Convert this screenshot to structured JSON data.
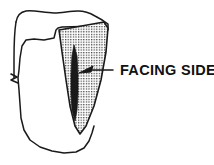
{
  "figure": {
    "background_color": "#ffffff",
    "ink_color": "#1a1a1a",
    "stipple_color": "#3a3a3a",
    "stipple_fill_color": "#e8e8e8",
    "blade_fill_color": "#1a1a1a"
  },
  "annotations": {
    "facing_side_label": "FACING SIDE"
  },
  "parts": {
    "stone_block_name": "stone-block",
    "facing_face_name": "facing-face",
    "break_mark_name": "break-mark",
    "blade_name": "blade-lens",
    "leader_name": "leader-line",
    "arrowhead_name": "arrowhead"
  },
  "geometry": {
    "width": 214,
    "height": 165,
    "stone_outline": "M 16,22 C 17,16 20,12 26,11 C 35,10 44,13 54,13 C 62,13 70,11 78,11 C 84,11 90,13 95,16 C 99,18 104,21 108,24 L 108,30 L 100,26 L 62,27 L 58,28 L 56,30 L 54,38 L 44,40 L 34,39 L 26,40 L 22,46 L 20,58 L 19,70 L 18,78 L 19,90 L 20,104 L 21,118 L 24,130 L 30,140 L 40,147 L 52,151 L 64,153 L 76,152 L 84,148 L 89,141 L 92,133 L 94,126",
    "stone_left_edge": "M 16,22 C 14,34 14,48 14,60 L 14,74 L 14,78",
    "facing_face": "M 59,30 L 104,22 L 108,28 L 106,52 L 101,80 L 94,106 L 86,126 L 80,134 L 75,126 L 70,106 L 66,80 L 62,52 Z",
    "blade_lens": "M 74,45 L 77,56 L 78,74 L 78,94 L 77,110 L 75,121 L 72,110 L 71,94 L 71,74 L 72,56 Z",
    "leader_line": "M 113,70 L 90,70",
    "arrowhead": "M 79,73 L 93,66 L 91,72 Z",
    "break_mark": "M 11,74 L 17,77 L 11,80 L 18,83",
    "label_x": 120,
    "label_y": 75
  }
}
